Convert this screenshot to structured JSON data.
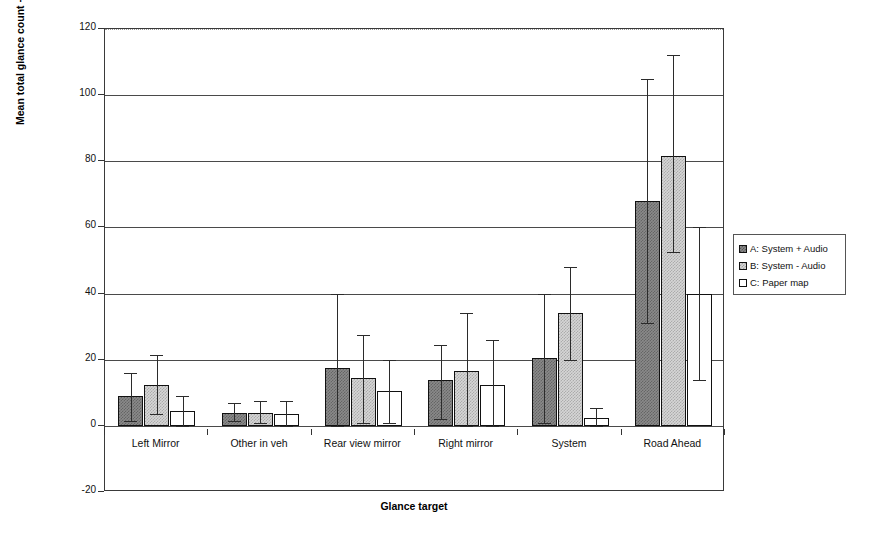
{
  "chart_data": {
    "type": "bar",
    "title": "",
    "xlabel": "Glance target",
    "ylabel": "Mean total glance count +/- 1 s.d.",
    "ylim": [
      -20,
      120
    ],
    "ytick_labels": [
      "120",
      "100",
      "80",
      "60",
      "40",
      "20",
      "0",
      "-20"
    ],
    "ytick_values": [
      120,
      100,
      80,
      60,
      40,
      20,
      0,
      -20
    ],
    "grid": true,
    "legend_position": "right",
    "categories": [
      "Left Mirror",
      "Other in veh",
      "Rear view mirror",
      "Right mirror",
      "System",
      "Road Ahead"
    ],
    "series": [
      {
        "name": "A: System + Audio",
        "key": "A",
        "color": "#8a8a8a",
        "values": [
          9,
          4,
          17.5,
          14,
          20.5,
          68
        ],
        "err_low": [
          1.5,
          1.5,
          0,
          2,
          1,
          31
        ],
        "err_high": [
          16,
          7,
          40,
          24.5,
          40,
          105
        ]
      },
      {
        "name": "B: System - Audio",
        "key": "B",
        "color": "#d6d6d6",
        "values": [
          12.5,
          4,
          14.5,
          16.5,
          34,
          81.5
        ],
        "err_low": [
          3.5,
          1,
          1,
          0,
          20,
          52.5
        ],
        "err_high": [
          21.5,
          7.5,
          27.5,
          34,
          48,
          112
        ]
      },
      {
        "name": "C: Paper map",
        "key": "C",
        "color": "#ffffff",
        "values": [
          4.5,
          3.5,
          10.5,
          12.5,
          2.5,
          40
        ],
        "err_low": [
          0,
          0,
          1,
          0,
          0,
          14
        ],
        "err_high": [
          9,
          7.5,
          20,
          26,
          5.5,
          60
        ]
      }
    ]
  },
  "legend": {
    "items": [
      {
        "label": "A: System + Audio",
        "key": "A"
      },
      {
        "label": "B: System - Audio",
        "key": "B"
      },
      {
        "label": "C: Paper map",
        "key": "C"
      }
    ]
  }
}
